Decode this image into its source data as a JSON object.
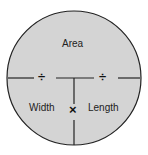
{
  "diagram": {
    "type": "formula-circle",
    "colors": {
      "fill": "#d4d4d4",
      "stroke": "#222222",
      "background": "#ffffff"
    },
    "top": {
      "label": "Area"
    },
    "bottom_left": {
      "label": "Width"
    },
    "bottom_right": {
      "label": "Length"
    },
    "operators": {
      "divide_left": "÷",
      "divide_right": "÷",
      "multiply": "×"
    }
  }
}
